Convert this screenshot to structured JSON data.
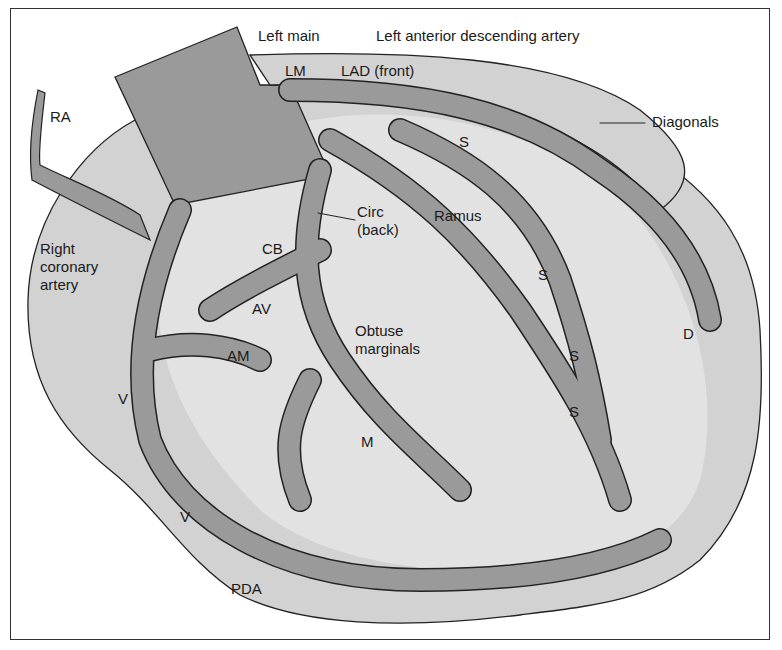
{
  "diagram": {
    "colors": {
      "background": "#ffffff",
      "heart": "#d2d2d2",
      "artery": "#9a9a9a",
      "outline": "#222222",
      "text": "#1a1a1a"
    },
    "labels": {
      "left_main": "Left main",
      "lad_full": "Left anterior descending artery",
      "lm": "LM",
      "lad_front": "LAD (front)",
      "ra": "RA",
      "diagonals": "Diagonals",
      "s1": "S",
      "circ": "Circ\n(back)",
      "ramus": "Ramus",
      "rca": "Right\ncoronary\nartery",
      "cb": "CB",
      "s2": "S",
      "av": "AV",
      "obtuse_marginals": "Obtuse\nmarginals",
      "d": "D",
      "am": "AM",
      "s3": "S",
      "s4": "S",
      "v1": "V",
      "m": "M",
      "v2": "V",
      "pda": "PDA"
    }
  }
}
